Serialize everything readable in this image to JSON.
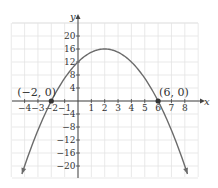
{
  "chart_data": {
    "type": "line",
    "title": "",
    "xlabel": "x",
    "ylabel": "y",
    "xlim": [
      -5,
      9
    ],
    "ylim": [
      -23,
      24
    ],
    "grid": true,
    "x_ticks": [
      -4,
      -3,
      -2,
      -1,
      1,
      2,
      3,
      4,
      5,
      6,
      7,
      8
    ],
    "x_tick_labels": [
      "−4",
      "−3",
      "−2",
      "−1",
      "1",
      "2",
      "3",
      "4",
      "5",
      "6",
      "7",
      "8"
    ],
    "y_ticks": [
      20,
      16,
      12,
      8,
      4,
      -4,
      -8,
      -12,
      -16,
      -20
    ],
    "y_tick_labels": [
      "20",
      "16",
      "12",
      "8",
      "4",
      "−4",
      "−8",
      "−12",
      "−16",
      "−20"
    ],
    "series": [
      {
        "name": "parabola",
        "equation": "y = -(x+2)(x-6)",
        "x": [
          -4.2,
          -4,
          -3,
          -2,
          -1,
          0,
          1,
          2,
          3,
          4,
          5,
          6,
          7,
          8,
          8.2
        ],
        "y": [
          -23.64,
          -20,
          -9,
          0,
          7,
          12,
          15,
          16,
          15,
          12,
          7,
          0,
          -9,
          -20,
          -23.64
        ]
      }
    ],
    "annotations": [
      {
        "label": "(−2, 0)",
        "x": -2,
        "y": 0
      },
      {
        "label": "(6, 0)",
        "x": 6,
        "y": 0
      }
    ],
    "colors": {
      "curve": "#6b6b6b",
      "grid": "#e3e3e3",
      "axis": "#444444",
      "point": "#333333"
    }
  }
}
